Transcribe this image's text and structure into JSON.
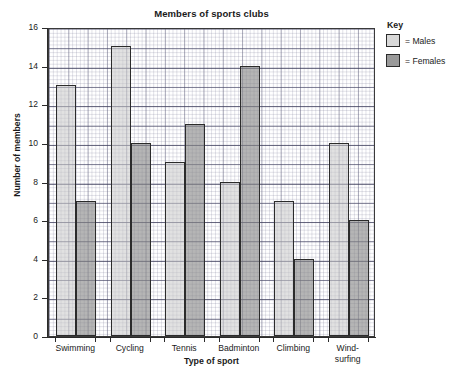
{
  "chart_data": {
    "type": "bar",
    "title": "Members of sports clubs",
    "xlabel": "Type of sport",
    "ylabel": "Number of members",
    "categories": [
      "Swimming",
      "Cycling",
      "Tennis",
      "Badminton",
      "Climbing",
      "Wind-surfing"
    ],
    "category_lines": [
      [
        "Swimming"
      ],
      [
        "Cycling"
      ],
      [
        "Tennis"
      ],
      [
        "Badminton"
      ],
      [
        "Climbing"
      ],
      [
        "Wind-",
        "surfing"
      ]
    ],
    "series": [
      {
        "name": "Males",
        "color": "#d8d8d8",
        "values": [
          13,
          15,
          9,
          8,
          7,
          10
        ]
      },
      {
        "name": "Females",
        "color": "#9a9a9a",
        "values": [
          7,
          10,
          11,
          14,
          4,
          6
        ]
      }
    ],
    "ylim": [
      0,
      16
    ],
    "ytick_step": 2,
    "yticks": [
      0,
      2,
      4,
      6,
      8,
      10,
      12,
      14,
      16
    ],
    "grid": true,
    "grid_style": "graph-paper",
    "legend_position": "right",
    "legend_title": "Key",
    "legend_entries": [
      {
        "label": "= Males",
        "series": "Males"
      },
      {
        "label": "= Females",
        "series": "Females"
      }
    ]
  }
}
